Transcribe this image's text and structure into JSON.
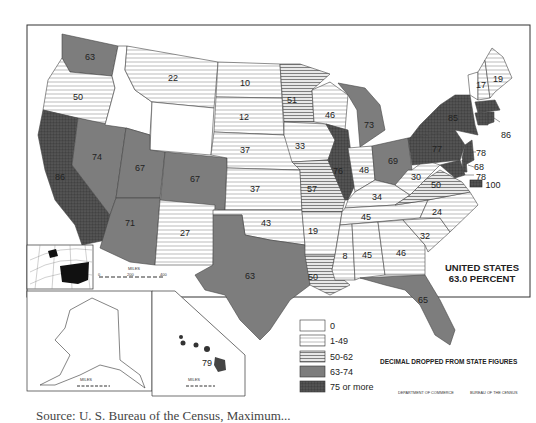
{
  "map": {
    "title": "UNITED STATES",
    "subtitle": "63.0 PERCENT",
    "note": "DECIMAL DROPPED FROM STATE FIGURES",
    "credit_left": "DEPARTMENT OF COMMERCE",
    "credit_right": "BUREAU OF THE CENSUS",
    "caption": "Source: U. S. Bureau of the Census, Maximum...",
    "legend": [
      {
        "label": "0",
        "class": "c0"
      },
      {
        "label": "1-49",
        "class": "c1"
      },
      {
        "label": "50-62",
        "class": "c2"
      },
      {
        "label": "63-74",
        "class": "c3"
      },
      {
        "label": "75 or more",
        "class": "c4"
      }
    ],
    "scales": {
      "main": {
        "unit": "MILES",
        "ticks": [
          "0",
          "200",
          "400"
        ]
      },
      "alaska": {
        "unit": "MILES",
        "ticks": [
          "0",
          "200",
          "400"
        ]
      },
      "hawaii": {
        "unit": "MILES",
        "ticks": [
          "0",
          "100",
          "200"
        ]
      }
    },
    "states": {
      "WA": "63",
      "OR": "50",
      "CA": "86",
      "NV": "74",
      "ID": "0",
      "MT": "22",
      "WY": "0",
      "UT": "67",
      "CO": "67",
      "AZ": "71",
      "NM": "27",
      "ND": "10",
      "SD": "12",
      "NE": "37",
      "KS": "37",
      "OK": "43",
      "TX": "63",
      "MN": "51",
      "IA": "33",
      "MO": "57",
      "AR": "19",
      "LA": "50",
      "WI": "46",
      "IL": "76",
      "MI": "73",
      "IN": "48",
      "OH": "69",
      "KY": "34",
      "TN": "45",
      "MS": "8",
      "AL": "45",
      "GA": "46",
      "FL": "65",
      "SC": "32",
      "NC": "24",
      "VA": "50",
      "WV": "30",
      "PA": "77",
      "NY": "85",
      "VT": "0",
      "NH": "17",
      "ME": "19",
      "MA": "85",
      "RI": "86",
      "CT": "77",
      "NJ": "78",
      "DE": "68",
      "MD": "78",
      "DC": "100",
      "HI": "79",
      "AK": "0"
    }
  }
}
